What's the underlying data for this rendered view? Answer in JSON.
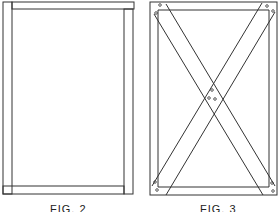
{
  "figures": [
    {
      "id": "fig2",
      "label": "FIG. 2",
      "description": "Rectangular frame with two vertical stiles and two horizontal rails"
    },
    {
      "id": "fig3",
      "label": "FIG. 3",
      "description": "Rectangular frame with two crossing diagonal braces fastened at ends and center"
    }
  ],
  "colors": {
    "line": "#333333",
    "background": "#ffffff"
  }
}
